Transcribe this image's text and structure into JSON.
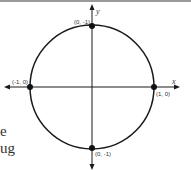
{
  "diagram": {
    "axes": {
      "x_label": "x",
      "y_label": "y"
    },
    "points": [
      {
        "label": "(0, -1)",
        "position": "top"
      },
      {
        "label": "(-1, 0)",
        "position": "left"
      },
      {
        "label": "(1, 0)",
        "position": "right"
      },
      {
        "label": "(0, -1)",
        "position": "bottom"
      }
    ]
  },
  "text_fragments": [
    "e",
    "ug"
  ],
  "colors": {
    "stroke": "#1a1a1a",
    "background": "#ffffff"
  }
}
